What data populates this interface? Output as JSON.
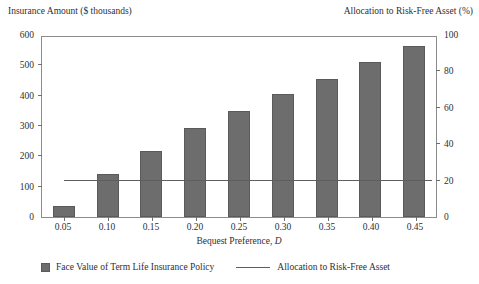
{
  "chart_data": {
    "type": "bar",
    "title": "",
    "xlabel": "Bequest Preference, D",
    "xlabel_plain": "Bequest Preference,",
    "xlabel_variable": "D",
    "ylabel": "Insurance Amount ($ thousands)",
    "ylabel_right": "Allocation to Risk-Free Asset (%)",
    "categories": [
      "0.05",
      "0.10",
      "0.15",
      "0.20",
      "0.25",
      "0.30",
      "0.35",
      "0.40",
      "0.45"
    ],
    "ylim": [
      0,
      600
    ],
    "yticks": [
      "600",
      "500",
      "400",
      "300",
      "200",
      "100",
      "0"
    ],
    "ylim_right": [
      0,
      100
    ],
    "yticks_right": [
      "100",
      "80",
      "60",
      "40",
      "20",
      "0"
    ],
    "grid": false,
    "legend_position": "bottom",
    "series": [
      {
        "name": "Face Value of Term Life Insurance Policy",
        "type": "bar",
        "axis": "left",
        "color": "#6d6d6d",
        "values": [
          36,
          142,
          218,
          292,
          350,
          406,
          455,
          510,
          565
        ]
      },
      {
        "name": "Allocation to Risk-Free Asset",
        "type": "line",
        "axis": "right",
        "color": "#5e5e5e",
        "values": [
          20,
          20,
          20,
          20,
          20,
          20,
          20,
          20,
          20
        ]
      }
    ]
  },
  "legend": {
    "bars_label": "Face Value of Term Life Insurance Policy",
    "line_label": "Allocation to Risk-Free Asset"
  }
}
